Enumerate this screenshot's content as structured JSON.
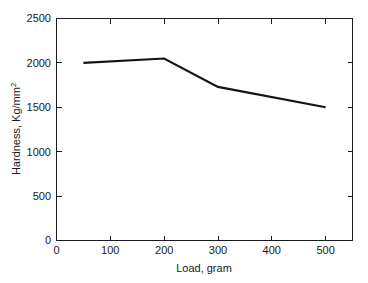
{
  "chart_data": {
    "type": "line",
    "title": "",
    "xlabel": "Load, gram",
    "ylabel": "Hardness, Kg/mm2",
    "ylabel_base": "Hardness, Kg/mm",
    "ylabel_sup": "2",
    "x": [
      50,
      200,
      300,
      500
    ],
    "values": [
      2000,
      2050,
      1730,
      1500
    ],
    "series": [
      {
        "name": "Hardness",
        "x": [
          50,
          200,
          300,
          500
        ],
        "values": [
          2000,
          2050,
          1730,
          1500
        ],
        "color": "#141414"
      }
    ],
    "xlim": [
      0,
      550
    ],
    "ylim": [
      0,
      2500
    ],
    "xticks": [
      0,
      100,
      200,
      300,
      400,
      500
    ],
    "xtick_labels": [
      "0",
      "100",
      "200",
      "300",
      "400",
      "500"
    ],
    "yticks": [
      0,
      500,
      1000,
      1500,
      2000,
      2500
    ],
    "ytick_labels": [
      "0",
      "500",
      "1000",
      "1500",
      "2000",
      "2500"
    ],
    "grid": false,
    "legend": false,
    "legend_position": "none",
    "background": "#ffffff",
    "axis_color": "#1a1a1a"
  }
}
